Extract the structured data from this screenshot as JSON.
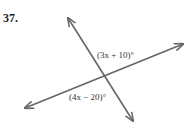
{
  "problem_number": "37.",
  "angle_labels": {
    "upper": "(3x + 10)°",
    "lower": "(4x − 20)°"
  },
  "colors": {
    "line": "#666666",
    "text": "#333333"
  }
}
